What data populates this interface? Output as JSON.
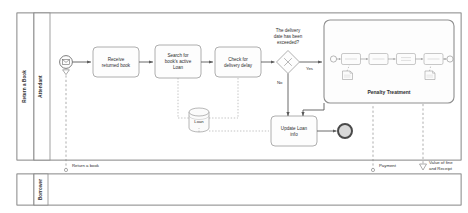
{
  "diagram": {
    "type": "BPMN process diagram",
    "title": "Return a Book"
  },
  "pools": [
    {
      "id": "pool-main",
      "label": "Return a Book",
      "lanes": [
        {
          "id": "lane-attendant",
          "label": "Attendant"
        }
      ]
    },
    {
      "id": "pool-borrower",
      "label": "",
      "lanes": [
        {
          "id": "lane-borrower",
          "label": "Borrower"
        }
      ]
    }
  ],
  "events": {
    "start": {
      "name": "message-start-event",
      "type": "message-start"
    },
    "end": {
      "name": "end-event",
      "type": "end"
    },
    "subprocess_start": {
      "name": "subprocess-start-event"
    },
    "subprocess_end": {
      "name": "subprocess-end-event"
    }
  },
  "tasks": [
    {
      "id": "task-receive",
      "label": "Receive\nreturned book",
      "line1": "Receive",
      "line2": "returned book"
    },
    {
      "id": "task-search",
      "label": "Search for book's active Loan",
      "line1": "Search for",
      "line2": "book's active",
      "line3": "Loan"
    },
    {
      "id": "task-check",
      "label": "Check for delivery delay",
      "line1": "Check for",
      "line2": "delivery delay"
    },
    {
      "id": "task-update",
      "label": "Update Loan info",
      "line1": "Update Loan",
      "line2": "info"
    }
  ],
  "gateway": {
    "id": "gateway-delivery-exceeded",
    "type": "exclusive",
    "question_line1": "The delivery",
    "question_line2": "date has been",
    "question_line3": "exceeded?",
    "branch_yes": "Yes",
    "branch_no": "No"
  },
  "subprocess": {
    "id": "subprocess-penalty-treatment",
    "label": "Penalty Treatment",
    "inner_tasks": [
      {
        "id": "inner-task-1",
        "label": ""
      },
      {
        "id": "inner-task-2",
        "label": ""
      },
      {
        "id": "inner-task-3",
        "label": ""
      },
      {
        "id": "inner-task-4",
        "label": ""
      }
    ]
  },
  "data": {
    "datastore_loan": {
      "id": "datastore-loan",
      "label": "Loan"
    }
  },
  "message_flows": [
    {
      "id": "msgflow-return-book",
      "label": "Return a book"
    },
    {
      "id": "msgflow-payment",
      "label": "Payment"
    },
    {
      "id": "msgflow-fine-receipt",
      "label_line1": "Value of fine",
      "label_line2": "and Receipt"
    }
  ],
  "colors": {
    "stroke": "#8a8a8a",
    "text": "#2e2e2e",
    "end_event_fill": "#d9d9d9",
    "background": "#ffffff"
  }
}
